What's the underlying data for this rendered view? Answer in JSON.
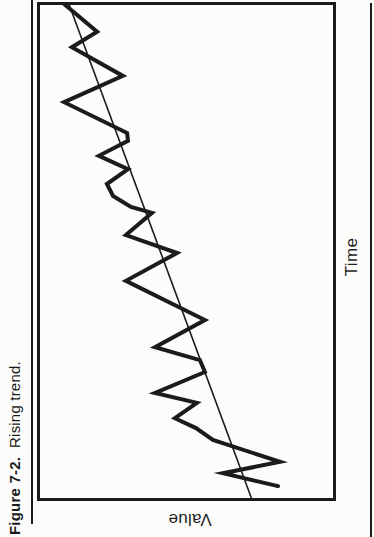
{
  "figure": {
    "caption_label": "Figure 7-2.",
    "caption_text": "Rising trend.",
    "xlabel": "Time",
    "ylabel": "Value"
  },
  "colors": {
    "ink": "#1b1b1b",
    "paper": "#fcfcfa"
  },
  "chart_data": {
    "type": "line",
    "xlabel": "Time",
    "ylabel": "Value",
    "axes_numeric": false,
    "grid": false,
    "legend": "none",
    "orientation_note": "scanned book figure rotated 90 degrees counter-clockwise on the page",
    "xlim": [
      0,
      100
    ],
    "ylim": [
      0,
      100
    ],
    "series": [
      {
        "name": "value-zigzag",
        "style": "thick jagged line",
        "points": [
          [
            2.8,
            19.2
          ],
          [
            5.4,
            37.7
          ],
          [
            7.7,
            18.5
          ],
          [
            12.1,
            41.1
          ],
          [
            14.5,
            46.8
          ],
          [
            16.5,
            53.9
          ],
          [
            19.6,
            46.5
          ],
          [
            21.6,
            60.6
          ],
          [
            25.8,
            43.8
          ],
          [
            28.2,
            45.5
          ],
          [
            30.8,
            60.6
          ],
          [
            36.3,
            43.8
          ],
          [
            44.2,
            70.4
          ],
          [
            49.8,
            53.2
          ],
          [
            53.4,
            70.4
          ],
          [
            57.9,
            61.6
          ],
          [
            59.1,
            68.7
          ],
          [
            61.3,
            74.7
          ],
          [
            63.7,
            76.8
          ],
          [
            66.7,
            69.7
          ],
          [
            69.4,
            79.5
          ],
          [
            72.4,
            69.7
          ],
          [
            74.0,
            70.0
          ],
          [
            80.2,
            91.2
          ],
          [
            85.5,
            71.4
          ],
          [
            91.3,
            88.6
          ],
          [
            94.4,
            80.1
          ],
          [
            100.0,
            91.2
          ]
        ]
      },
      {
        "name": "trend-line",
        "style": "thin straight line",
        "points": [
          [
            0,
            27.9
          ],
          [
            100,
            89.6
          ]
        ]
      }
    ]
  },
  "plot_px": {
    "x_right_origin": 335,
    "y_bottom_origin": 500,
    "px_per_value": 2.97,
    "px_per_time": 4.96,
    "zigzag_stroke": 4,
    "trend_stroke": 1.6
  }
}
